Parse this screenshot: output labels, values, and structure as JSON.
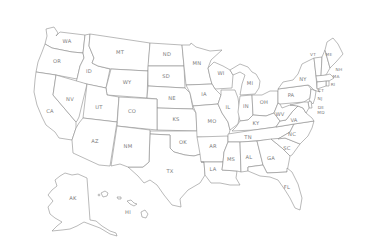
{
  "map": {
    "title": "United States",
    "colors": {
      "background": "#ffffff",
      "fill": "#ffffff",
      "stroke": "#8c8c8c",
      "label": "#7a7a7a"
    },
    "states": [
      {
        "abbr": "WA",
        "x": 67,
        "y": 42
      },
      {
        "abbr": "OR",
        "x": 57,
        "y": 62
      },
      {
        "abbr": "ID",
        "x": 89,
        "y": 72
      },
      {
        "abbr": "MT",
        "x": 120,
        "y": 53
      },
      {
        "abbr": "WY",
        "x": 127,
        "y": 83
      },
      {
        "abbr": "ND",
        "x": 167,
        "y": 55
      },
      {
        "abbr": "SD",
        "x": 166,
        "y": 77
      },
      {
        "abbr": "NE",
        "x": 172,
        "y": 99
      },
      {
        "abbr": "KS",
        "x": 176,
        "y": 120
      },
      {
        "abbr": "OK",
        "x": 183,
        "y": 143
      },
      {
        "abbr": "TX",
        "x": 170,
        "y": 172
      },
      {
        "abbr": "CA",
        "x": 50,
        "y": 112
      },
      {
        "abbr": "NV",
        "x": 70,
        "y": 100
      },
      {
        "abbr": "UT",
        "x": 99,
        "y": 108
      },
      {
        "abbr": "CO",
        "x": 132,
        "y": 112
      },
      {
        "abbr": "AZ",
        "x": 95,
        "y": 142
      },
      {
        "abbr": "NM",
        "x": 128,
        "y": 147
      },
      {
        "abbr": "MN",
        "x": 197,
        "y": 64
      },
      {
        "abbr": "WI",
        "x": 221,
        "y": 74
      },
      {
        "abbr": "IA",
        "x": 204,
        "y": 95
      },
      {
        "abbr": "MO",
        "x": 212,
        "y": 122
      },
      {
        "abbr": "AR",
        "x": 213,
        "y": 147
      },
      {
        "abbr": "LA",
        "x": 213,
        "y": 170
      },
      {
        "abbr": "IL",
        "x": 228,
        "y": 108
      },
      {
        "abbr": "MI",
        "x": 250,
        "y": 84
      },
      {
        "abbr": "IN",
        "x": 246,
        "y": 107
      },
      {
        "abbr": "OH",
        "x": 264,
        "y": 103
      },
      {
        "abbr": "KY",
        "x": 256,
        "y": 124
      },
      {
        "abbr": "TN",
        "x": 248,
        "y": 138
      },
      {
        "abbr": "MS",
        "x": 231,
        "y": 160
      },
      {
        "abbr": "AL",
        "x": 249,
        "y": 158
      },
      {
        "abbr": "GA",
        "x": 271,
        "y": 159
      },
      {
        "abbr": "FL",
        "x": 287,
        "y": 188
      },
      {
        "abbr": "SC",
        "x": 287,
        "y": 149
      },
      {
        "abbr": "NC",
        "x": 292,
        "y": 135
      },
      {
        "abbr": "VA",
        "x": 294,
        "y": 121
      },
      {
        "abbr": "WV",
        "x": 280,
        "y": 115
      },
      {
        "abbr": "PA",
        "x": 291,
        "y": 96
      },
      {
        "abbr": "NY",
        "x": 303,
        "y": 80
      },
      {
        "abbr": "VT",
        "x": 313,
        "y": 55
      },
      {
        "abbr": "ME",
        "x": 329,
        "y": 55
      },
      {
        "abbr": "NH",
        "x": 339,
        "y": 70
      },
      {
        "abbr": "MA",
        "x": 336,
        "y": 77
      },
      {
        "abbr": "RI",
        "x": 333,
        "y": 85
      },
      {
        "abbr": "CT",
        "x": 321,
        "y": 91
      },
      {
        "abbr": "NJ",
        "x": 320,
        "y": 99
      },
      {
        "abbr": "DE",
        "x": 321,
        "y": 108
      },
      {
        "abbr": "MD",
        "x": 321,
        "y": 113
      },
      {
        "abbr": "AK",
        "x": 73,
        "y": 199
      },
      {
        "abbr": "HI",
        "x": 128,
        "y": 213
      }
    ]
  }
}
